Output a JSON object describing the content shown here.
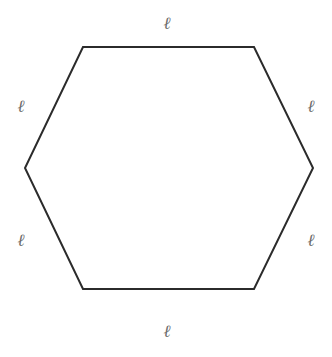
{
  "diagram": {
    "shape": "regular hexagon",
    "stroke_color": "#2b2b2b",
    "label_color": "#6a6a6a",
    "vertices": [
      [
        83,
        47
      ],
      [
        254,
        47
      ],
      [
        313,
        168
      ],
      [
        254,
        289
      ],
      [
        83,
        289
      ],
      [
        25,
        168
      ]
    ],
    "side_labels": [
      {
        "id": "top",
        "text": "ℓ",
        "x": 167,
        "y": 29
      },
      {
        "id": "upper-right",
        "text": "ℓ",
        "x": 311,
        "y": 112
      },
      {
        "id": "lower-right",
        "text": "ℓ",
        "x": 311,
        "y": 246
      },
      {
        "id": "bottom",
        "text": "ℓ",
        "x": 167,
        "y": 337
      },
      {
        "id": "lower-left",
        "text": "ℓ",
        "x": 21,
        "y": 246
      },
      {
        "id": "upper-left",
        "text": "ℓ",
        "x": 21,
        "y": 112
      }
    ]
  }
}
